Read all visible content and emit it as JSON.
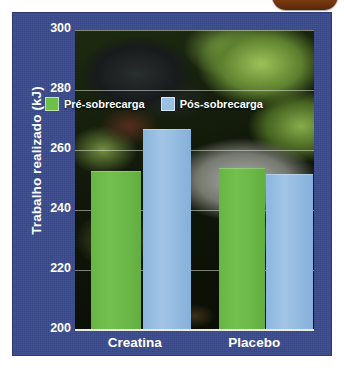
{
  "chart_data": {
    "type": "bar",
    "title": "",
    "xlabel": "",
    "ylabel": "Trabalho realizado (kJ)",
    "categories": [
      "Creatina",
      "Placebo"
    ],
    "series": [
      {
        "name": "Pré-sobrecarga",
        "color": "#6ebe4a",
        "values": [
          253,
          254
        ]
      },
      {
        "name": "Pós-sobrecarga",
        "color": "#9cc0e2",
        "values": [
          267,
          252
        ]
      }
    ],
    "ylim": [
      200,
      300
    ],
    "yticks": [
      300,
      280,
      260,
      240,
      220,
      200
    ],
    "ytick_labels": [
      "300",
      "280",
      "260",
      "240",
      "220",
      "200"
    ],
    "grid": true,
    "legend_position": "top-center-inside"
  },
  "colors": {
    "panel_blue": "#3a4a8c",
    "series_green": "#6ebe4a",
    "series_blue": "#9cc0e2",
    "axis_white": "#ffffff",
    "tab_brown": "#8d4512"
  }
}
